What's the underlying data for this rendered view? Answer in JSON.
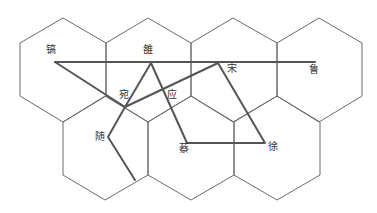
{
  "diagram": {
    "type": "hex-grid-route-map",
    "hex_stroke_color": "#6a6a6a",
    "route_color": "#555555",
    "hexagons": [
      {
        "id": "r1c1",
        "points": "20,43 63,18 106,43 106,96 63,122 20,96"
      },
      {
        "id": "r1c2",
        "points": "106,43 148,18 191,43 191,96 148,122 106,96"
      },
      {
        "id": "r1c3",
        "points": "191,43 233,18 277,43 277,96 233,122 191,96"
      },
      {
        "id": "r1c4",
        "points": "277,43 319,18 362,43 362,96 319,122 277,96"
      },
      {
        "id": "r2c1",
        "points": "63,122 105,96 148,122 148,175 105,200 63,175"
      },
      {
        "id": "r2c2",
        "points": "148,122 191,96 234,122 234,175 191,200 148,175"
      },
      {
        "id": "r2c3",
        "points": "234,122 277,96 320,122 320,175 277,200 234,175"
      }
    ],
    "routes": [
      {
        "id": "gao-lu",
        "points": "55,62 315,62"
      },
      {
        "id": "gao-wan",
        "points": "55,62 125,107"
      },
      {
        "id": "wan-song-xu-cai-luo-wan-sui",
        "points": "125,107 218,63 265,143 187,143 151,63 125,107 108,137 135,180"
      }
    ],
    "labels": [
      {
        "id": "gao",
        "text": "镐",
        "x": 46,
        "y": 44
      },
      {
        "id": "luo",
        "text": "雒",
        "x": 143,
        "y": 44
      },
      {
        "id": "song",
        "text": "宋",
        "x": 227,
        "y": 63
      },
      {
        "id": "lu",
        "text": "鲁",
        "x": 309,
        "y": 64
      },
      {
        "id": "wan",
        "text": "宛",
        "x": 119,
        "y": 89
      },
      {
        "id": "ying",
        "text": "应",
        "x": 167,
        "y": 89
      },
      {
        "id": "sui",
        "text": "随",
        "x": 95,
        "y": 131
      },
      {
        "id": "cai",
        "text": "蔡",
        "x": 179,
        "y": 143
      },
      {
        "id": "xu",
        "text": "徐",
        "x": 268,
        "y": 141
      }
    ]
  }
}
